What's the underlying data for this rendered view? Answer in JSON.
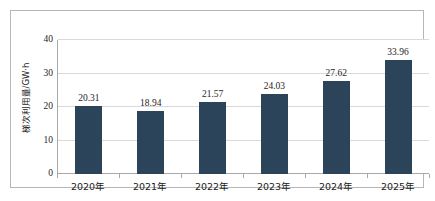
{
  "chart_data": {
    "type": "bar",
    "title": "",
    "subtitle": "",
    "xlabel": "",
    "ylabel": "梯次利用量/GW·h",
    "categories": [
      "2020年",
      "2021年",
      "2022年",
      "2023年",
      "2024年",
      "2025年"
    ],
    "values": [
      20.31,
      18.94,
      21.57,
      24.03,
      27.62,
      33.96
    ],
    "value_labels": [
      "20.31",
      "18.94",
      "21.57",
      "24.03",
      "27.62",
      "33.96"
    ],
    "ylim": [
      0,
      40
    ],
    "ytick_labels": [
      "0",
      "10",
      "20",
      "30",
      "40"
    ],
    "ytick_values": [
      0,
      10,
      20,
      30,
      40
    ],
    "grid": true,
    "grid_axis": "y",
    "legend": false,
    "legend_position": "none",
    "series": [
      {
        "name": "梯次利用量",
        "values": [
          20.31,
          18.94,
          21.57,
          24.03,
          27.62,
          33.96
        ]
      }
    ],
    "colors": {
      "bar": "#2c4459",
      "gridline": "#d9d9d9",
      "axis": "#a9a9a9",
      "frame": "#b6b6b6",
      "text": "#262626",
      "background": "#ffffff"
    }
  }
}
